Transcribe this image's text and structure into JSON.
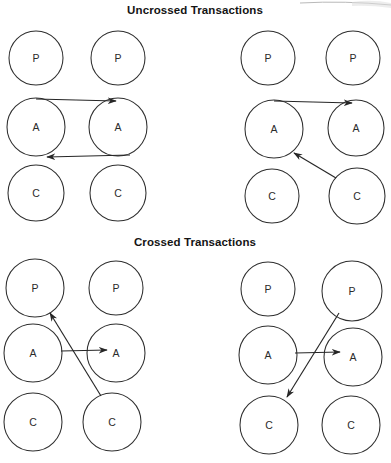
{
  "page": {
    "width": 391,
    "height": 463,
    "background": "#ffffff",
    "ink_color": "#262626",
    "title_color": "#141414"
  },
  "sections": [
    {
      "id": "uncrossed",
      "title": "Uncrossed Transactions",
      "title_x": 195,
      "title_y": 14,
      "panels": [
        {
          "id": "uncrossed-left",
          "nodes": [
            {
              "id": "ul-p-left",
              "label": "P",
              "cx": 36,
              "cy": 58,
              "r": 27
            },
            {
              "id": "ul-p-right",
              "label": "P",
              "cx": 118,
              "cy": 58,
              "r": 27
            },
            {
              "id": "ul-a-left",
              "label": "A",
              "cx": 36,
              "cy": 127,
              "r": 29
            },
            {
              "id": "ul-a-right",
              "label": "A",
              "cx": 118,
              "cy": 127,
              "r": 29
            },
            {
              "id": "ul-c-left",
              "label": "C",
              "cx": 36,
              "cy": 193,
              "r": 28
            },
            {
              "id": "ul-c-right",
              "label": "C",
              "cx": 118,
              "cy": 193,
              "r": 28
            }
          ],
          "edges": [
            {
              "id": "ul-edge-a-to-a-top",
              "from": "ul-a-left",
              "to": "ul-a-right",
              "x1": 36,
              "y1": 99,
              "x2": 116,
              "y2": 101,
              "arrow": "end"
            },
            {
              "id": "ul-edge-a-to-a-bottom",
              "from": "ul-a-right",
              "to": "ul-a-left",
              "x1": 130,
              "y1": 155,
              "x2": 47,
              "y2": 157,
              "arrow": "end"
            }
          ]
        },
        {
          "id": "uncrossed-right",
          "nodes": [
            {
              "id": "ur-p-left",
              "label": "P",
              "cx": 268,
              "cy": 58,
              "r": 27
            },
            {
              "id": "ur-p-right",
              "label": "P",
              "cx": 353,
              "cy": 58,
              "r": 27
            },
            {
              "id": "ur-a-left",
              "label": "A",
              "cx": 274,
              "cy": 129,
              "r": 29
            },
            {
              "id": "ur-a-right",
              "label": "A",
              "cx": 356,
              "cy": 128,
              "r": 28
            },
            {
              "id": "ur-c-left",
              "label": "C",
              "cx": 272,
              "cy": 196,
              "r": 27
            },
            {
              "id": "ur-c-right",
              "label": "C",
              "cx": 357,
              "cy": 196,
              "r": 28
            }
          ],
          "edges": [
            {
              "id": "ur-edge-a-to-a",
              "from": "ur-a-left",
              "to": "ur-a-right",
              "x1": 274,
              "y1": 101,
              "x2": 352,
              "y2": 103,
              "arrow": "end"
            },
            {
              "id": "ur-edge-c-to-a",
              "from": "ur-c-right",
              "to": "ur-a-left",
              "x1": 336,
              "y1": 178,
              "x2": 294,
              "y2": 153,
              "arrow": "end"
            }
          ]
        }
      ]
    },
    {
      "id": "crossed",
      "title": "Crossed Transactions",
      "title_x": 195,
      "title_y": 246,
      "panels": [
        {
          "id": "crossed-left",
          "nodes": [
            {
              "id": "cl-p-left",
              "label": "P",
              "cx": 35,
              "cy": 288,
              "r": 29
            },
            {
              "id": "cl-p-right",
              "label": "P",
              "cx": 116,
              "cy": 288,
              "r": 27
            },
            {
              "id": "cl-a-left",
              "label": "A",
              "cx": 33,
              "cy": 353,
              "r": 29
            },
            {
              "id": "cl-a-right",
              "label": "A",
              "cx": 116,
              "cy": 353,
              "r": 29
            },
            {
              "id": "cl-c-left",
              "label": "C",
              "cx": 33,
              "cy": 422,
              "r": 29
            },
            {
              "id": "cl-c-right",
              "label": "C",
              "cx": 112,
              "cy": 422,
              "r": 29
            }
          ],
          "edges": [
            {
              "id": "cl-edge-c-to-p",
              "from": "cl-c-right",
              "to": "cl-p-left",
              "x1": 101,
              "y1": 396,
              "x2": 50,
              "y2": 313,
              "arrow": "end"
            },
            {
              "id": "cl-edge-a-to-a",
              "from": "cl-a-left",
              "to": "cl-a-right",
              "x1": 61,
              "y1": 351,
              "x2": 107,
              "y2": 350,
              "arrow": "end"
            }
          ]
        },
        {
          "id": "crossed-right",
          "nodes": [
            {
              "id": "cr-p-left",
              "label": "P",
              "cx": 268,
              "cy": 289,
              "r": 27
            },
            {
              "id": "cr-p-right",
              "label": "P",
              "cx": 352,
              "cy": 291,
              "r": 30
            },
            {
              "id": "cr-a-left",
              "label": "A",
              "cx": 268,
              "cy": 355,
              "r": 29
            },
            {
              "id": "cr-a-right",
              "label": "A",
              "cx": 353,
              "cy": 357,
              "r": 29
            },
            {
              "id": "cr-c-left",
              "label": "C",
              "cx": 269,
              "cy": 425,
              "r": 29
            },
            {
              "id": "cr-c-right",
              "label": "C",
              "cx": 351,
              "cy": 425,
              "r": 29
            }
          ],
          "edges": [
            {
              "id": "cr-edge-p-to-c",
              "from": "cr-p-right",
              "to": "cr-c-left",
              "x1": 339,
              "y1": 313,
              "x2": 287,
              "y2": 397,
              "arrow": "end"
            },
            {
              "id": "cr-edge-a-to-a",
              "from": "cr-a-left",
              "to": "cr-a-right",
              "x1": 295,
              "y1": 353,
              "x2": 340,
              "y2": 352,
              "arrow": "end"
            }
          ]
        }
      ]
    }
  ],
  "legend": {
    "node_meanings": [
      {
        "letter": "P",
        "role": "Parent"
      },
      {
        "letter": "A",
        "role": "Adult"
      },
      {
        "letter": "C",
        "role": "Child"
      }
    ]
  }
}
